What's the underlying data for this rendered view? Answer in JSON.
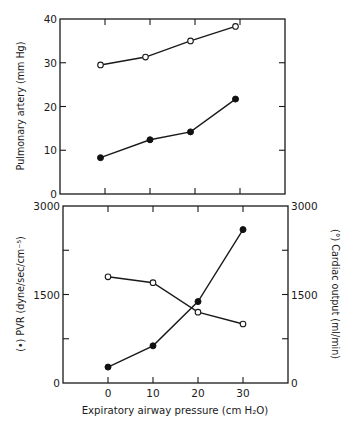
{
  "chart_data": [
    {
      "type": "line",
      "panel": "top",
      "title": "",
      "xlabel": "",
      "ylabel": "Pulmonary artery (mm Hg)",
      "xlim": [
        -10,
        40
      ],
      "ylim": [
        0,
        40
      ],
      "xticks": [
        0,
        10,
        20,
        30
      ],
      "yticks": [
        0,
        10,
        20,
        30,
        40
      ],
      "ytick_labels": [
        "0",
        "10",
        "20",
        "30",
        "40"
      ],
      "grid": false,
      "legend": null,
      "series": [
        {
          "name": "open circles (pulmonary artery, upper)",
          "marker": "open",
          "x": [
            -1,
            9,
            19,
            29
          ],
          "values": [
            29.5,
            31.3,
            35.0,
            38.3
          ]
        },
        {
          "name": "filled circles (pulmonary artery, lower)",
          "marker": "filled",
          "x": [
            -1,
            10,
            19,
            29
          ],
          "values": [
            8.3,
            12.4,
            14.2,
            21.7
          ]
        }
      ]
    },
    {
      "type": "line",
      "panel": "bottom",
      "title": "",
      "xlabel": "Expiratory airway pressure (cm H₂O)",
      "ylabel": "(•) PVR (dyne/sec/cm⁻⁵)",
      "ylabel_right": "(°) Cardiac output (ml/min)",
      "xlim": [
        -10,
        40
      ],
      "ylim": [
        0,
        3000
      ],
      "ylim_right": [
        0,
        3000
      ],
      "xticks": [
        0,
        10,
        20,
        30
      ],
      "xtick_labels": [
        "0",
        "10",
        "20",
        "30"
      ],
      "yticks": [
        0,
        750,
        1500,
        2250,
        3000
      ],
      "ytick_labels": [
        "0",
        "",
        "1500",
        "",
        "3000"
      ],
      "ytick_labels_right": [
        "0",
        "",
        "1500",
        "",
        "3000"
      ],
      "grid": false,
      "legend": null,
      "series": [
        {
          "name": "PVR",
          "marker": "filled",
          "axis": "left",
          "x": [
            0,
            10,
            20,
            30
          ],
          "values": [
            270,
            630,
            1380,
            2600
          ]
        },
        {
          "name": "Cardiac output",
          "marker": "open",
          "axis": "right",
          "x": [
            0,
            10,
            20,
            30
          ],
          "values": [
            1800,
            1700,
            1200,
            1000
          ]
        }
      ]
    }
  ],
  "labels": {
    "top_ylabel": "Pulmonary artery (mm Hg)",
    "bottom_ylabel_left": "(•) PVR (dyne/sec/cm⁻⁵)",
    "bottom_ylabel_right": "(°) Cardiac output (ml/min)",
    "xlabel": "Expiratory airway pressure (cm H₂O)"
  }
}
